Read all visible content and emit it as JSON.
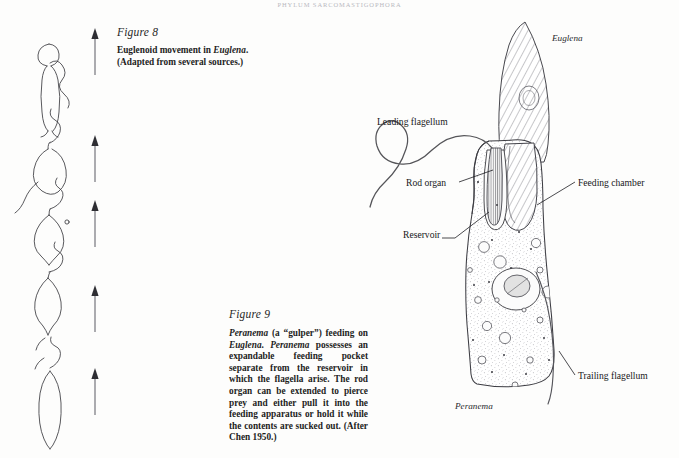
{
  "page": {
    "running_head": "PHYLUM SARCOMASTIGOPHORA",
    "folio": "",
    "background_color": "#fdfdfc",
    "ink_color": "#1a1a1a"
  },
  "figure8": {
    "label": "Figure 8",
    "caption_line1_prefix": "Euglenoid movement in ",
    "caption_line1_italic": "Euglena",
    "caption_line1_suffix": ".",
    "caption_line2": "(Adapted from several sources.)",
    "arrow_count": 5,
    "cell_stage_count": 5,
    "arrow_direction": "up"
  },
  "figure9": {
    "label": "Figure 9",
    "caption_segments": [
      {
        "text": "Peranema",
        "italic": true
      },
      {
        "text": " (a “gulper”) feeding on ",
        "italic": false
      },
      {
        "text": "Euglena",
        "italic": true
      },
      {
        "text": ". ",
        "italic": false
      },
      {
        "text": "Peranema",
        "italic": true
      },
      {
        "text": " possesses an expandable feeding pocket separate from the reservoir in which the flagella arise. The rod organ can be extended to pierce prey and either pull it into the feeding apparatus or hold it while the contents are sucked out. (After Chen 1950.)",
        "italic": false
      }
    ]
  },
  "diagram_labels": {
    "leading_flagellum": "Leading flagellum",
    "rod_organ": "Rod organ",
    "feeding_chamber": "Feeding chamber",
    "reservoir": "Reservoir",
    "trailing_flagellum": "Trailing flagellum",
    "euglena": "Euglena",
    "peranema": "Peranema"
  },
  "chart_data": {
    "type": "diagram",
    "structures": [
      "leading flagellum",
      "rod organ",
      "feeding chamber",
      "reservoir",
      "trailing flagellum",
      "Euglena prey",
      "Peranema body"
    ]
  }
}
